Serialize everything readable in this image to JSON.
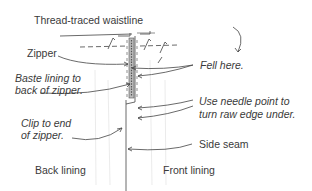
{
  "diagram": {
    "type": "sewing-illustration",
    "labels": {
      "waistline": "Thread-traced waistline",
      "zipper": "Zipper",
      "baste_line1": "Baste lining to",
      "baste_line2": "back of zipper.",
      "clip_line1": "Clip to end",
      "clip_line2": "of zipper.",
      "back_lining": "Back lining",
      "fell": "Fell here.",
      "needle_line1": "Use needle point to",
      "needle_line2": "turn raw edge under.",
      "side_seam": "Side seam",
      "front_lining": "Front lining"
    },
    "colors": {
      "line": "#333333",
      "text": "#3a3a3a",
      "background": "#ffffff"
    }
  }
}
